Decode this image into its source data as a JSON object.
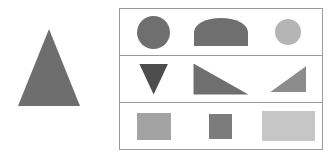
{
  "figure": {
    "background_color": "#ffffff",
    "width": 331,
    "height": 161
  },
  "left_panel": {
    "name": "reference-shape-panel",
    "shape": {
      "label": "triangle",
      "kind": "triangle-up",
      "color": "#6e6e6e",
      "width_px": 62,
      "height_px": 77
    }
  },
  "grid_panel": {
    "name": "shape-grid",
    "border_color": "#9a9a9a",
    "divider_color": "#9a9a9a",
    "rows": [
      {
        "label": "row-circles",
        "cells": [
          {
            "label": "circle",
            "kind": "circle",
            "color": "#6f6f6f",
            "width_px": 33,
            "height_px": 33
          },
          {
            "label": "semicircle",
            "kind": "semicircle",
            "color": "#6f6f6f",
            "width_px": 54,
            "height_px": 28
          },
          {
            "label": "circle-small-light",
            "kind": "circle",
            "color": "#b5b5b5",
            "width_px": 26,
            "height_px": 26
          }
        ]
      },
      {
        "label": "row-triangles",
        "cells": [
          {
            "label": "triangle-down",
            "kind": "triangle-down",
            "color": "#4d4d4d",
            "width_px": 29,
            "height_px": 31
          },
          {
            "label": "right-triangle-left-angle",
            "kind": "right-triangle-bottom-left",
            "color": "#6f6f6f",
            "width_px": 55,
            "height_px": 31
          },
          {
            "label": "right-triangle-right-angle",
            "kind": "right-triangle-bottom-right",
            "color": "#8c8c8c",
            "width_px": 36,
            "height_px": 26
          }
        ]
      },
      {
        "label": "row-rectangles",
        "cells": [
          {
            "label": "rectangle",
            "kind": "rectangle",
            "color": "#a3a3a3",
            "width_px": 34,
            "height_px": 27
          },
          {
            "label": "square-small",
            "kind": "square",
            "color": "#7c7c7c",
            "width_px": 23,
            "height_px": 25
          },
          {
            "label": "rectangle-wide-light",
            "kind": "rectangle",
            "color": "#c6c6c6",
            "width_px": 53,
            "height_px": 30
          }
        ]
      }
    ]
  }
}
